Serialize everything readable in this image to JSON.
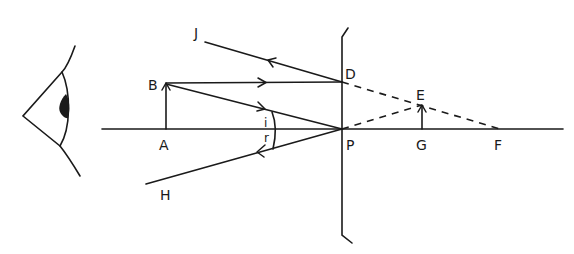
{
  "figure": {
    "points": {
      "A": "A",
      "B": "B",
      "D": "D",
      "E": "E",
      "F": "F",
      "G": "G",
      "H": "H",
      "J": "J",
      "P": "P"
    },
    "angles": {
      "incidence": "i",
      "reflection": "r"
    },
    "colors": {
      "ink": "#1a1a1a",
      "background": "#ffffff"
    }
  }
}
